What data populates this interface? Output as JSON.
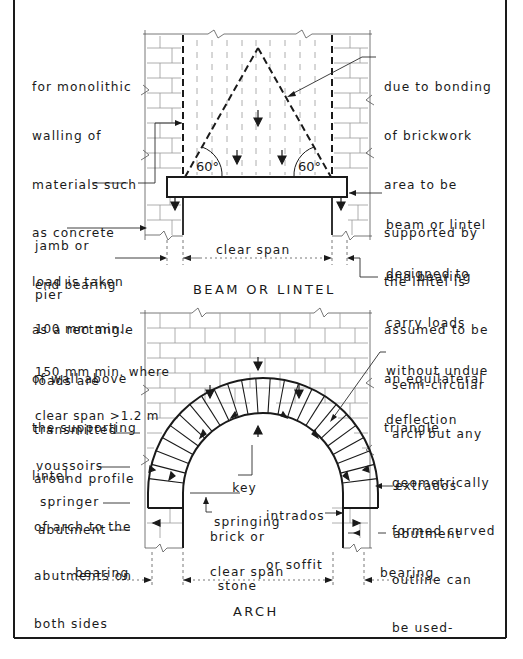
{
  "figure": {
    "beam_section": {
      "heading": "BEAM OR LINTEL",
      "angle_left": "60°",
      "angle_right": "60°",
      "labels": {
        "monolithic": [
          "for monolithic",
          "walling of",
          "materials such",
          "as concrete",
          "load is taken",
          "as a rectangle",
          "of wall above",
          "the supporting",
          "lintel"
        ],
        "triangle": [
          "due to bonding",
          "of brickwork",
          "area to be",
          "supported by",
          "the lintel is",
          "assumed to be",
          "an equilateral",
          "triangle"
        ],
        "beam": [
          "beam or lintel",
          "designed to",
          "carry loads",
          "without undue",
          "deflection"
        ],
        "jamb": [
          "jamb or",
          "pier"
        ],
        "end_bearing_left": [
          "end bearing",
          "100 mm min..",
          "150 mm min. where",
          "clear span >1.2 m"
        ],
        "end_bearing_right": "end bearing",
        "clear_span": "clear span"
      }
    },
    "arch_section": {
      "heading": "ARCH",
      "labels": {
        "loads": [
          "loads are",
          "transmitted",
          "around profile",
          "of arch to the",
          "abutments on",
          "both sides"
        ],
        "semicircular": [
          "semi-circular",
          "arch but any",
          "geometrically",
          "formed curved",
          "outline can",
          "be used-"
        ],
        "voussoirs": "voussoirs",
        "springer": "springer",
        "abutment_left": "abutment",
        "abutment_right": "abutment",
        "key": [
          "key",
          "brick or",
          "stone"
        ],
        "intrados": [
          "intrados",
          "or soffit"
        ],
        "extrados": "extrados",
        "springing": "springing",
        "bearing_left": "bearing",
        "bearing_right": "bearing",
        "clear_span": "clear span"
      }
    }
  }
}
